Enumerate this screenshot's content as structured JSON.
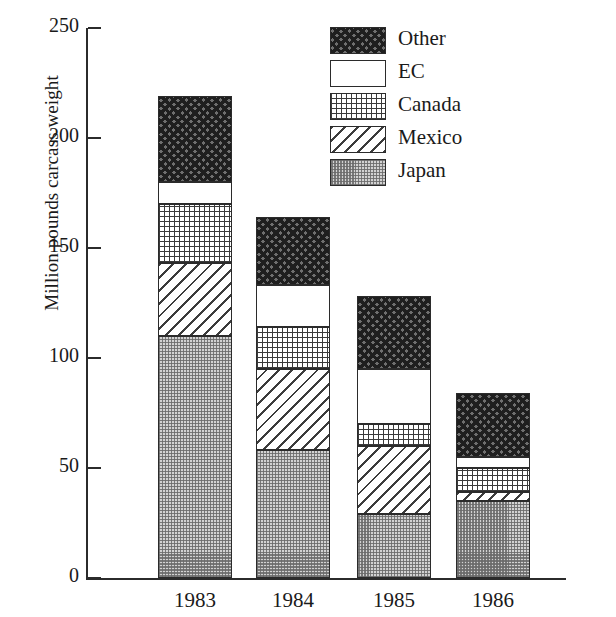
{
  "chart_data": {
    "type": "bar",
    "stacked": true,
    "title": "",
    "xlabel": "",
    "ylabel": "Million pounds carcass weight",
    "categories": [
      "1983",
      "1984",
      "1985",
      "1986"
    ],
    "ylim": [
      0,
      250
    ],
    "yticks": [
      0,
      50,
      100,
      150,
      200,
      250
    ],
    "ytick_labels": [
      "0",
      "50",
      "100",
      "150",
      "200",
      "250"
    ],
    "grid": false,
    "legend_position": "top-right",
    "series": [
      {
        "name": "Japan",
        "pattern": "gray-checker",
        "values": [
          110,
          58,
          29,
          35
        ]
      },
      {
        "name": "Mexico",
        "pattern": "diagonal-hatch",
        "values": [
          33,
          37,
          31,
          4
        ]
      },
      {
        "name": "Canada",
        "pattern": "fine-dot-grid",
        "values": [
          27,
          19,
          10,
          11
        ]
      },
      {
        "name": "EC",
        "pattern": "white",
        "values": [
          10,
          19,
          25,
          5
        ]
      },
      {
        "name": "Other",
        "pattern": "dark-crosshatch",
        "values": [
          39,
          31,
          33,
          29
        ]
      }
    ],
    "totals": [
      219,
      164,
      128,
      84
    ],
    "cumulative_tops": {
      "1983": {
        "Japan": 110,
        "Mexico": 143,
        "Canada": 170,
        "EC": 180,
        "Other": 219
      },
      "1984": {
        "Japan": 58,
        "Mexico": 95,
        "Canada": 114,
        "EC": 133,
        "Other": 164
      },
      "1985": {
        "Japan": 29,
        "Mexico": 60,
        "Canada": 70,
        "EC": 95,
        "Other": 128
      },
      "1986": {
        "Japan": 35,
        "Mexico": 39,
        "Canada": 50,
        "EC": 55,
        "Other": 84
      }
    }
  },
  "legend": {
    "items": [
      {
        "label": "Other",
        "pattern": "dark-crosshatch"
      },
      {
        "label": "EC",
        "pattern": "white"
      },
      {
        "label": "Canada",
        "pattern": "fine-dot-grid"
      },
      {
        "label": "Mexico",
        "pattern": "diagonal-hatch"
      },
      {
        "label": "Japan",
        "pattern": "gray-checker"
      }
    ]
  },
  "colors": {
    "axis": "#2b2b2b",
    "text": "#1a1a1a",
    "background": "#ffffff",
    "other_fill": "#6f6f6f",
    "japan_fill": "#d2d2d2"
  }
}
